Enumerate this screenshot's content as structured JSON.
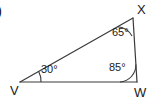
{
  "figure": {
    "kind": "triangle-geometry-diagram",
    "item_marker": ")",
    "stroke_color": "#3a3a3a",
    "text_color": "#1a1a1a",
    "background_color": "#ffffff"
  },
  "vertices": {
    "V": {
      "label": "V",
      "x": 20,
      "y": 82
    },
    "W": {
      "label": "W",
      "x": 137,
      "y": 82
    },
    "X": {
      "label": "X",
      "x": 133,
      "y": 18
    }
  },
  "angles": {
    "V": {
      "label": "30°",
      "value": 30
    },
    "X": {
      "label": "65°",
      "value": 65
    },
    "W": {
      "label": "85°",
      "value": 85
    }
  },
  "sides": {
    "VW": {
      "from": "V",
      "to": "W"
    },
    "WX": {
      "from": "W",
      "to": "X"
    },
    "VX": {
      "from": "V",
      "to": "X"
    }
  }
}
